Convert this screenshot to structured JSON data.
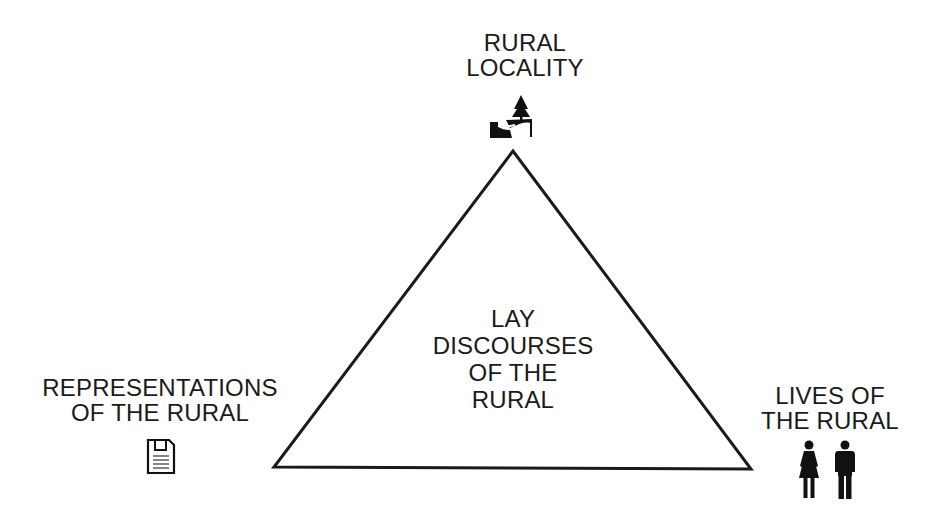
{
  "diagram": {
    "type": "triangle",
    "center_label": [
      "LAY",
      "DISCOURSES",
      "OF THE",
      "RURAL"
    ],
    "vertices": {
      "top": {
        "label": [
          "RURAL",
          "LOCALITY"
        ],
        "icon": "rural-landscape-tree-icon"
      },
      "bottom_left": {
        "label": [
          "REPRESENTATIONS",
          "OF THE RURAL"
        ],
        "icon": "document-icon"
      },
      "bottom_right": {
        "label": [
          "LIVES OF",
          "THE RURAL"
        ],
        "icon": "people-woman-man-icon"
      }
    },
    "stroke_color": "#1a1a1a",
    "background": "#ffffff"
  }
}
